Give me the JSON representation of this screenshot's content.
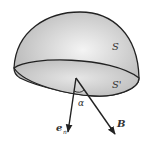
{
  "diagram": {
    "labels": {
      "outer_surface": "S",
      "base_surface": "S'",
      "angle": "α",
      "normal_vector": "e",
      "normal_subscript": "n",
      "field_vector": "B"
    },
    "colors": {
      "dome_fill": "#cfcfcf",
      "base_fill": "#bdbdbd",
      "stroke": "#222222"
    }
  }
}
